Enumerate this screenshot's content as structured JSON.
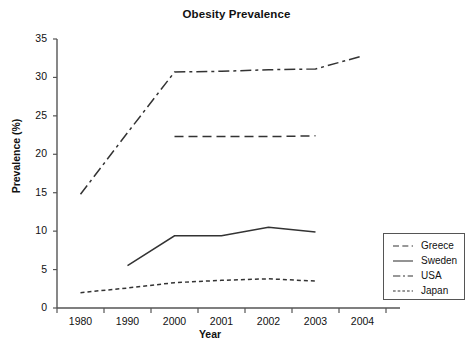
{
  "chart_data": {
    "type": "line",
    "title": "Obesity Prevalence",
    "xlabel": "Year",
    "ylabel": "Prevalence (%)",
    "categories": [
      "1980",
      "1990",
      "2000",
      "2001",
      "2002",
      "2003",
      "2004"
    ],
    "ylim": [
      0,
      35
    ],
    "ytick_values": [
      "0",
      "5",
      "10",
      "15",
      "20",
      "25",
      "30",
      "35"
    ],
    "grid": false,
    "legend_position": "bottom-right inside",
    "series": [
      {
        "name": "Greece",
        "style": "long-dash",
        "color": "#333333",
        "values": [
          null,
          null,
          22.3,
          22.3,
          22.3,
          22.4,
          null
        ]
      },
      {
        "name": "Sweden",
        "style": "solid",
        "color": "#333333",
        "values": [
          null,
          5.5,
          9.4,
          9.4,
          10.5,
          9.9,
          null
        ]
      },
      {
        "name": "USA",
        "style": "dash-dot",
        "color": "#333333",
        "values": [
          14.8,
          22.8,
          30.7,
          30.8,
          31.0,
          31.1,
          32.8
        ]
      },
      {
        "name": "Japan",
        "style": "short-dash",
        "color": "#333333",
        "values": [
          2.0,
          2.6,
          3.3,
          3.6,
          3.8,
          3.5,
          null
        ]
      }
    ]
  },
  "legend": {
    "entries": [
      {
        "label": "Greece"
      },
      {
        "label": "Sweden"
      },
      {
        "label": "USA"
      },
      {
        "label": "Japan"
      }
    ]
  }
}
